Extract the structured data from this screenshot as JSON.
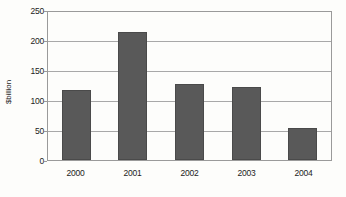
{
  "chart_data": {
    "type": "bar",
    "title": "",
    "subtitle": "",
    "xlabel": "",
    "ylabel": "$billion",
    "categories": [
      "2000",
      "2001",
      "2002",
      "2003",
      "2004"
    ],
    "values": [
      118,
      217,
      129,
      123,
      54
    ],
    "series": [
      {
        "name": "",
        "values": [
          118,
          217,
          129,
          123,
          54
        ]
      }
    ],
    "ylim": [
      0,
      250
    ],
    "ytick_labels": [
      "0",
      "50",
      "100",
      "150",
      "200",
      "250"
    ],
    "ytick_values": [
      0,
      50,
      100,
      150,
      200,
      250
    ],
    "grid": "horizontal",
    "legend": "none",
    "bar_color": "#595959",
    "axis_color": "#9a9a9a",
    "gridline_color": "#a8a8a8",
    "text_color": "#1c1c1c",
    "background_color": "#fdfdfb"
  }
}
